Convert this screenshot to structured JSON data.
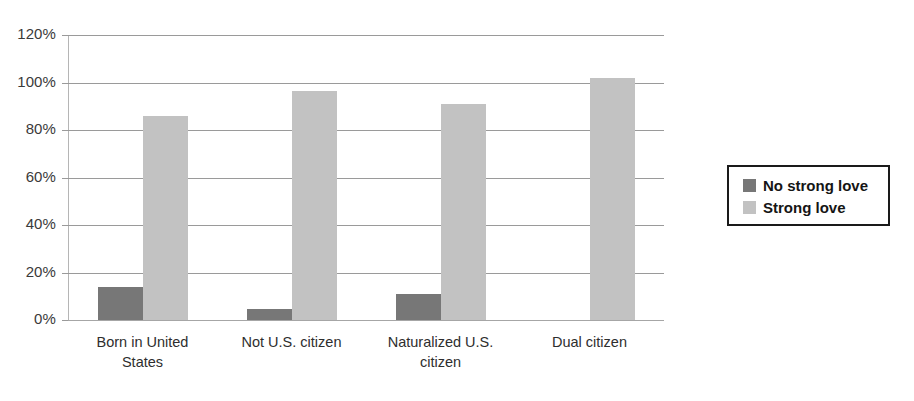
{
  "chart_data": {
    "type": "bar",
    "title": "",
    "subtitle": "",
    "xlabel": "",
    "ylabel": "",
    "ylim": [
      0,
      120
    ],
    "ytick_labels": [
      "120%",
      "100%",
      "80%",
      "60%",
      "40%",
      "20%",
      "0%"
    ],
    "ytick_values": [
      120,
      100,
      80,
      60,
      40,
      20,
      0
    ],
    "grid": true,
    "grid_axis": "y",
    "legend_position": "right",
    "categories": [
      "Born in United\nStates",
      "Not U.S. citizen",
      "Naturalized U.S.\ncitizen",
      "Dual citizen"
    ],
    "series": [
      {
        "name": "No strong love",
        "color": "#777777",
        "values": [
          14,
          4.5,
          11,
          0
        ]
      },
      {
        "name": "Strong love",
        "color": "#c2c2c2",
        "values": [
          86,
          96.5,
          91,
          102
        ]
      }
    ]
  },
  "legend": {
    "items": [
      {
        "label": "No strong love",
        "color": "#777777"
      },
      {
        "label": "Strong love",
        "color": "#c2c2c2"
      }
    ]
  },
  "colors": {
    "no_strong_love": "#777777",
    "strong_love": "#c2c2c2",
    "gridline": "#9a9a9a",
    "axis": "#b5b5b5",
    "background": "#ffffff"
  }
}
